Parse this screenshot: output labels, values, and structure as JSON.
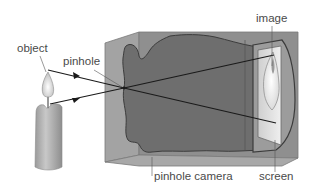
{
  "diagram": {
    "labels": {
      "object": "object",
      "pinhole": "pinhole",
      "image": "image",
      "pinhole_camera": "pinhole camera",
      "screen": "screen"
    },
    "components": [
      {
        "name": "candle",
        "role": "object"
      },
      {
        "name": "pinhole",
        "role": "aperture"
      },
      {
        "name": "camera-box",
        "role": "pinhole camera"
      },
      {
        "name": "screen",
        "role": "screen"
      },
      {
        "name": "inverted-image",
        "role": "image"
      }
    ],
    "rays": [
      {
        "from": "flame-tip",
        "to": "screen-bottom",
        "via": "pinhole"
      },
      {
        "from": "candle-top",
        "to": "screen-top",
        "via": "pinhole"
      }
    ],
    "colors": {
      "box_front": "#8e8e8e",
      "box_top": "#a9a9a9",
      "box_interior": "#6f6f6f",
      "box_side": "#9a9a9a",
      "screen": "#d9d9d9",
      "ray": "#1a1a1a",
      "label_text": "#4a4a4a",
      "candle": "#b8b8b8"
    }
  }
}
